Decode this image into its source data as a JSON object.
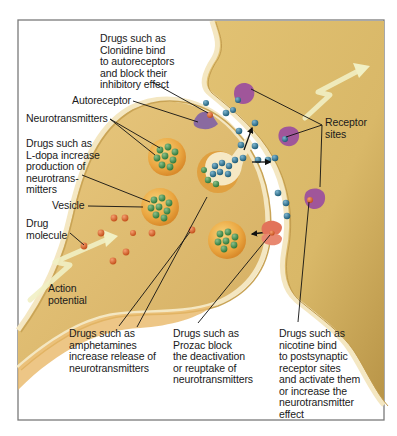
{
  "colors": {
    "frame": "#7a7a7a",
    "neuron_fill": "#e6c47a",
    "neuron_shade": "#c9a456",
    "membrane": "#f4e7c2",
    "cleft": "#ffffff",
    "vesicle": "#eaa640",
    "neurotransmitter": "#3f8a4a",
    "released_transmitter": "#2d6f8c",
    "drug_molecule": "#d9642a",
    "receptor": "#a0569a",
    "autoreceptor": "#8a6aa0",
    "reuptake_transporter": "#e2735a",
    "action_potential_arrow": "#f1f0c4"
  },
  "labels": {
    "clonidine": "Drugs such as\nClonidine bind\nto autoreceptors\nand block their\ninhibitory effect",
    "autoreceptor": "Autoreceptor",
    "neurotransmitters": "Neurotransmitters",
    "ldopa": "Drugs such as\nL-dopa increase\nproduction of\nneurotrans-\nmitters",
    "vesicle": "Vesicle",
    "drug_molecule": "Drug\nmolecule",
    "action_potential": "Action\npotential",
    "receptor_sites": "Receptor\nsites",
    "amphetamines": "Drugs such as\namphetamines\nincrease release of\nneurotransmitters",
    "prozac": "Drugs such as\nProzac block\nthe deactivation\nor reuptake of\nneurotransmitters",
    "nicotine": "Drugs such as\nnicotine bind\nto postsynaptic\nreceptor sites\nand activate them\nor increase the\nneurotransmitter\neffect"
  }
}
